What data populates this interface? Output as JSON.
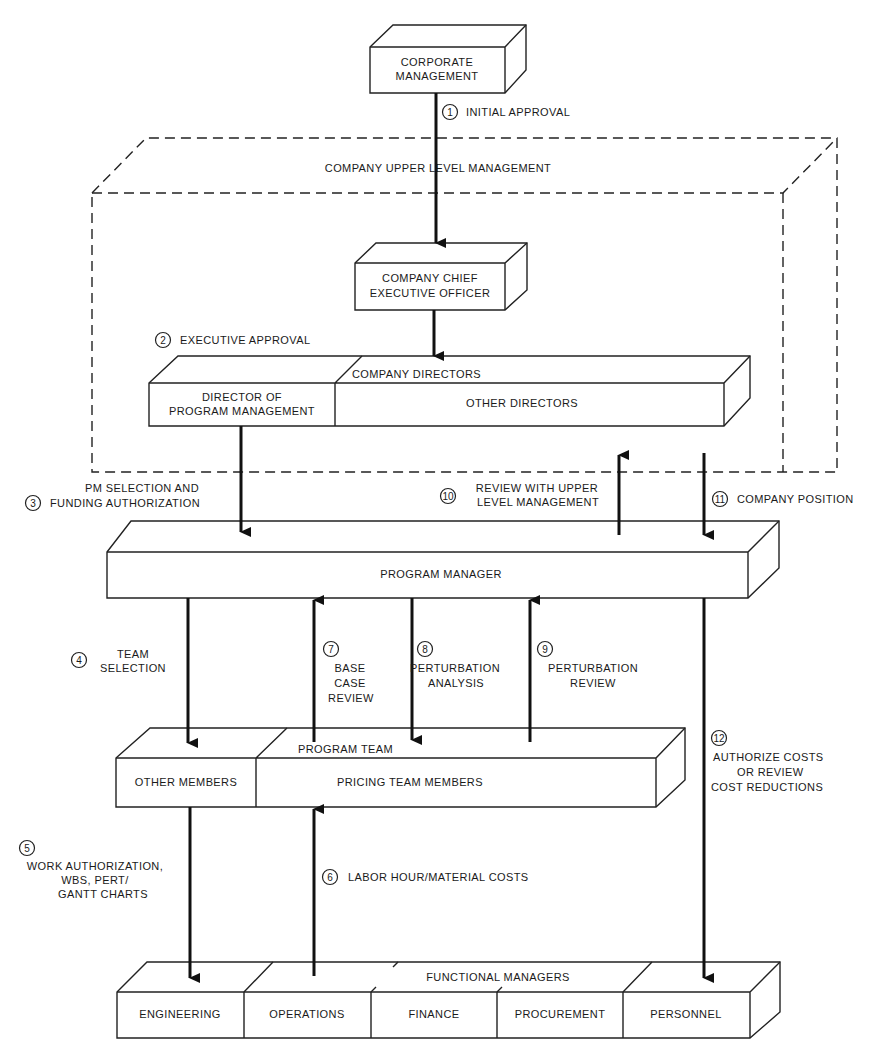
{
  "diagram": {
    "region": {
      "label": "COMPANY UPPER LEVEL MANAGEMENT"
    },
    "boxes": {
      "corporate": {
        "line1": "CORPORATE",
        "line2": "MANAGEMENT"
      },
      "ceo": {
        "line1": "COMPANY CHIEF",
        "line2": "EXECUTIVE OFFICER"
      },
      "directors": {
        "group": "COMPANY DIRECTORS",
        "dpm_line1": "DIRECTOR OF",
        "dpm_line2": "PROGRAM MANAGEMENT",
        "other": "OTHER DIRECTORS"
      },
      "program_manager": {
        "label": "PROGRAM MANAGER"
      },
      "program_team": {
        "group": "PROGRAM TEAM",
        "other": "OTHER MEMBERS",
        "pricing": "PRICING TEAM MEMBERS"
      },
      "functional": {
        "group": "FUNCTIONAL MANAGERS",
        "cells": [
          "ENGINEERING",
          "OPERATIONS",
          "FINANCE",
          "PROCUREMENT",
          "PERSONNEL"
        ]
      }
    },
    "steps": [
      {
        "n": "1",
        "lines": [
          "INITIAL APPROVAL"
        ]
      },
      {
        "n": "2",
        "lines": [
          "EXECUTIVE APPROVAL"
        ]
      },
      {
        "n": "3",
        "lines": [
          "PM SELECTION AND",
          "FUNDING AUTHORIZATION"
        ]
      },
      {
        "n": "4",
        "lines": [
          "TEAM",
          "SELECTION"
        ]
      },
      {
        "n": "5",
        "lines": [
          "WORK AUTHORIZATION,",
          "WBS, PERT/",
          "GANTT CHARTS"
        ]
      },
      {
        "n": "6",
        "lines": [
          "LABOR HOUR/MATERIAL COSTS"
        ]
      },
      {
        "n": "7",
        "lines": [
          "BASE",
          "CASE",
          "REVIEW"
        ]
      },
      {
        "n": "8",
        "lines": [
          "PERTURBATION",
          "ANALYSIS"
        ]
      },
      {
        "n": "9",
        "lines": [
          "PERTURBATION",
          "REVIEW"
        ]
      },
      {
        "n": "10",
        "lines": [
          "REVIEW WITH UPPER",
          "LEVEL MANAGEMENT"
        ]
      },
      {
        "n": "11",
        "lines": [
          "COMPANY POSITION"
        ]
      },
      {
        "n": "12",
        "lines": [
          "AUTHORIZE COSTS",
          "OR REVIEW",
          "COST REDUCTIONS"
        ]
      }
    ]
  }
}
